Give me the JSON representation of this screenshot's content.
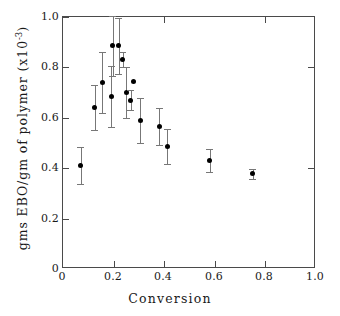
{
  "figure": {
    "background_color": "#ffffff",
    "frame_color": "#4a4a4a",
    "marker_color": "#000000",
    "errorbar_color": "#777777"
  },
  "chart_data": {
    "type": "scatter",
    "title": "",
    "xlabel": "Conversion",
    "ylabel": "gms EBO/gm of polymer (x10",
    "ylabel_exponent": "-3",
    "ylabel_suffix": ")",
    "xlim": [
      0,
      1.0
    ],
    "ylim": [
      0,
      1.0
    ],
    "grid": false,
    "legend": null,
    "xticks": [
      0,
      0.2,
      0.4,
      0.6,
      0.8,
      1.0
    ],
    "xtick_labels": [
      "0",
      "0.2",
      "0.4",
      "0.6",
      "0.8",
      "1.0"
    ],
    "yticks": [
      0,
      0.2,
      0.4,
      0.6,
      0.8,
      1.0
    ],
    "ytick_labels": [
      "0",
      "0.2",
      "0.4",
      "0.6",
      "0.8",
      "1.0"
    ],
    "x": [
      0.07,
      0.125,
      0.155,
      0.19,
      0.196,
      0.22,
      0.236,
      0.25,
      0.268,
      0.28,
      0.305,
      0.38,
      0.412,
      0.58,
      0.75
    ],
    "y": [
      0.41,
      0.64,
      0.74,
      0.685,
      0.885,
      0.885,
      0.83,
      0.7,
      0.67,
      0.745,
      0.59,
      0.565,
      0.485,
      0.43,
      0.378
    ],
    "yerr": [
      0.073,
      0.09,
      0.12,
      0.12,
      0.118,
      0.112,
      0.03,
      0.1,
      0.04,
      0.0,
      0.09,
      0.072,
      0.07,
      0.045,
      0.02
    ],
    "n_points": 15,
    "series_name": "EBO per gram of polymer vs conversion"
  }
}
